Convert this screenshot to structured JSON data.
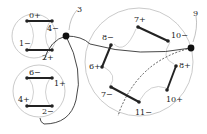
{
  "diagram": {
    "callouts": [
      {
        "label": "3"
      },
      {
        "label": "9"
      }
    ],
    "circles": [
      {
        "id": "top-left",
        "vertices": [
          "0+",
          "4−",
          "1−",
          "2+"
        ]
      },
      {
        "id": "bottom-left",
        "vertices": [
          "6−",
          "1+",
          "4+",
          "2−"
        ]
      },
      {
        "id": "right",
        "vertices": [
          "7+",
          "10−",
          "8−",
          "6+",
          "8+",
          "10+",
          "7−",
          "11−"
        ]
      }
    ],
    "colors": {
      "edge": "#222222",
      "circle": "#bdbdbd",
      "curve": "#333333"
    }
  }
}
